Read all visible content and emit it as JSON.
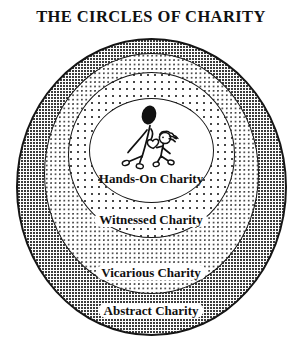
{
  "title": "THE CIRCLES OF CHARITY",
  "rings": [
    {
      "label": "Hands-On Charity",
      "zone": "innermost circle",
      "fill": "white"
    },
    {
      "label": "Witnessed Charity",
      "zone": "second circle",
      "fill": "sparse-dots"
    },
    {
      "label": "Vicarious Charity",
      "zone": "third circle",
      "fill": "medium-stipple"
    },
    {
      "label": "Abstract Charity",
      "zone": "outermost circle",
      "fill": "dense-stipple"
    }
  ],
  "illustration": {
    "name": "adult-helping-child-stick-figures",
    "elements": [
      "adult-figure",
      "child-figure",
      "heart"
    ]
  },
  "colors": {
    "ink": "#111111",
    "background": "#ffffff",
    "stipple": "#191919"
  }
}
